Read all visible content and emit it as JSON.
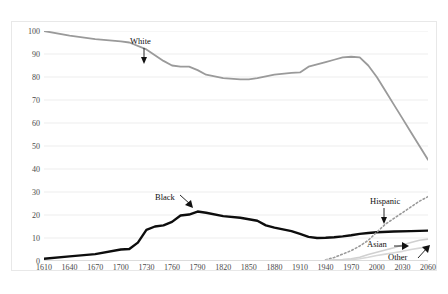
{
  "figure": {
    "background": "#ffffff",
    "frame_color": "#e8e8e8",
    "faint_header_left": "",
    "faint_header_right": ""
  },
  "chart_data": {
    "type": "line",
    "title": "",
    "xlabel": "",
    "ylabel": "Percent of U.S. Population",
    "xlim": [
      1610,
      2060
    ],
    "ylim": [
      0,
      100
    ],
    "grid": true,
    "grid_axis": "y",
    "legend_position": "inline-annotations",
    "y_ticks": [
      0,
      10,
      20,
      30,
      40,
      50,
      60,
      70,
      80,
      90,
      100
    ],
    "x_ticks": [
      1610,
      1640,
      1670,
      1700,
      1730,
      1760,
      1790,
      1820,
      1850,
      1880,
      1910,
      1940,
      1970,
      2000,
      2030,
      2060
    ],
    "series": [
      {
        "name": "White",
        "color": "#9a9a9a",
        "width": 1.8,
        "dash": "solid",
        "x": [
          1610,
          1640,
          1670,
          1700,
          1710,
          1730,
          1750,
          1760,
          1770,
          1780,
          1790,
          1800,
          1820,
          1840,
          1850,
          1860,
          1880,
          1900,
          1910,
          1920,
          1930,
          1940,
          1950,
          1960,
          1970,
          1980,
          1990,
          2000,
          2010,
          2020,
          2030,
          2040,
          2050,
          2060
        ],
        "y": [
          100,
          98,
          96.5,
          95.5,
          95,
          92,
          87,
          85,
          84.5,
          84.5,
          83,
          81,
          79.5,
          79,
          79,
          79.5,
          81,
          81.8,
          82,
          84.5,
          85.5,
          86.5,
          87.5,
          88.5,
          88.8,
          88.5,
          85,
          80,
          74,
          68,
          62,
          56,
          50,
          44
        ]
      },
      {
        "name": "Black",
        "color": "#0d0d0d",
        "width": 2.4,
        "dash": "solid",
        "x": [
          1610,
          1640,
          1670,
          1700,
          1710,
          1720,
          1730,
          1740,
          1750,
          1760,
          1770,
          1780,
          1790,
          1800,
          1820,
          1840,
          1860,
          1870,
          1880,
          1900,
          1910,
          1920,
          1930,
          1940,
          1950,
          1960,
          1970,
          1980,
          1990,
          2000,
          2020,
          2040,
          2060
        ],
        "y": [
          1,
          2,
          3,
          5,
          5.2,
          8,
          13.5,
          15,
          15.5,
          17,
          19.8,
          20.2,
          21.5,
          21,
          19.5,
          18.8,
          17.5,
          15.5,
          14.5,
          13,
          11.8,
          10.5,
          10,
          10.1,
          10.3,
          10.7,
          11.2,
          11.8,
          12.2,
          12.5,
          12.8,
          13,
          13.2
        ]
      },
      {
        "name": "Hispanic",
        "color": "#9a9a9a",
        "width": 1.6,
        "dash": "dotted",
        "x": [
          1940,
          1950,
          1960,
          1970,
          1980,
          1990,
          2000,
          2010,
          2020,
          2030,
          2040,
          2050,
          2060
        ],
        "y": [
          0.5,
          1.5,
          3,
          4.5,
          6.5,
          9,
          12.5,
          16,
          18.5,
          21,
          23.5,
          26,
          28
        ]
      },
      {
        "name": "Asian",
        "color": "#d0d0d0",
        "width": 1.6,
        "dash": "solid",
        "x": [
          1940,
          1960,
          1970,
          1980,
          1990,
          2000,
          2010,
          2020,
          2030,
          2040,
          2050,
          2060
        ],
        "y": [
          0.3,
          0.6,
          1,
          1.6,
          2.8,
          3.8,
          4.8,
          5.8,
          7,
          8,
          9,
          9.5
        ]
      },
      {
        "name": "Other",
        "color": "#d7d7d7",
        "width": 1.6,
        "dash": "solid",
        "x": [
          1940,
          1960,
          1970,
          1980,
          1990,
          2000,
          2010,
          2020,
          2030,
          2040,
          2050,
          2060
        ],
        "y": [
          0.2,
          0.4,
          0.6,
          1,
          1.6,
          2.4,
          3,
          3.6,
          4.2,
          5,
          5.6,
          6.2
        ]
      }
    ],
    "annotations": [
      {
        "label": "White",
        "x_px": 130,
        "y_px": 36,
        "arrow": "down"
      },
      {
        "label": "Black",
        "x_px": 155,
        "y_px": 192,
        "arrow": "down-right"
      },
      {
        "label": "Hispanic",
        "x_px": 370,
        "y_px": 196,
        "arrow": "down"
      },
      {
        "label": "Asian",
        "x_px": 367,
        "y_px": 239,
        "arrow": "right"
      },
      {
        "label": "Other",
        "x_px": 388,
        "y_px": 252,
        "arrow": "up-right"
      }
    ]
  }
}
